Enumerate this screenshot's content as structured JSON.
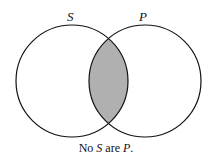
{
  "diagram": {
    "type": "venn",
    "circles": [
      {
        "label": "S",
        "cx": 72,
        "cy": 81,
        "r": 56
      },
      {
        "label": "P",
        "cx": 145,
        "cy": 81,
        "r": 56
      }
    ],
    "shaded_region": "S∩P",
    "shade_color": "#b0b0b0",
    "stroke_color": "#111111",
    "caption": {
      "prefix": "No ",
      "term1": "S",
      "middle": " are ",
      "term2": "P",
      "suffix": "."
    }
  }
}
